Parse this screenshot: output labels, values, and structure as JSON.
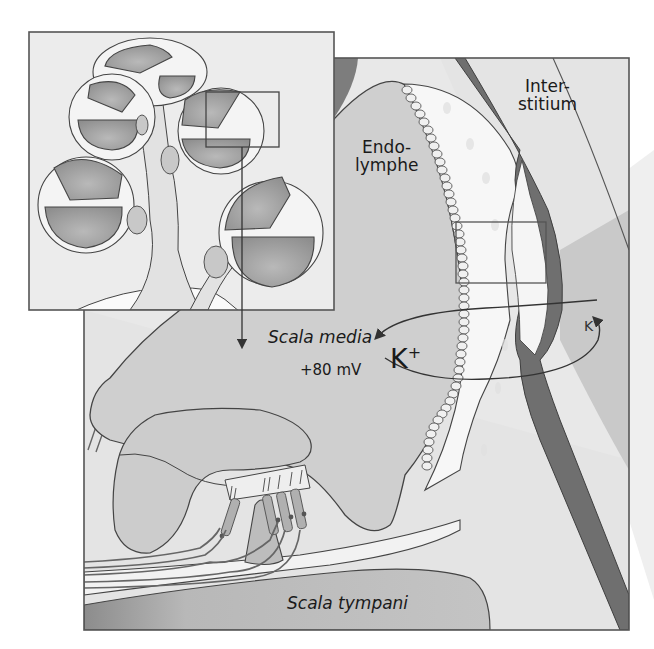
{
  "diagram": {
    "labels": {
      "endolymphe": [
        "Endo-",
        "lymphe"
      ],
      "interstitium": [
        "Inter-",
        "stitium"
      ],
      "scala_media": "Scala media",
      "potential": "+80 mV",
      "k_ion_large": "K",
      "k_ion_large_charge": "+",
      "k_ion_small": "K",
      "k_ion_small_charge": "+",
      "scala_tympani": "Scala tympani"
    },
    "inset": {
      "description": "Overview of cochlear turns around modiolus",
      "highlight_box": "zoomed region",
      "arrow": "points to detailed view"
    },
    "detail_box": "stria vascularis region",
    "colors": {
      "frame": "#555555",
      "background_light": "#e6e6e6",
      "scala_media_fill": "#cdcdcd",
      "dark_fill": "#8a8a8a",
      "vessel": "#6e6e6e",
      "white_tissue": "#f6f6f6",
      "text": "#1a1a1a"
    }
  }
}
